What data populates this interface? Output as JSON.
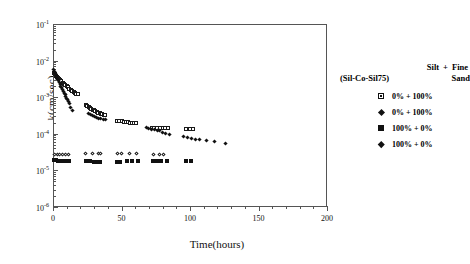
{
  "chart_data": {
    "type": "scatter",
    "title": "",
    "xlabel": "Time(hours)",
    "ylabel": "k(cm/sec)",
    "xlim": [
      0,
      200
    ],
    "ylim": [
      1e-06,
      0.1
    ],
    "yscale": "log",
    "xscale": "linear",
    "grid": false,
    "legend_position": "right",
    "xticks": [
      "0",
      "50",
      "100",
      "150",
      "200"
    ],
    "xtick_values": [
      0,
      50,
      100,
      150,
      200
    ],
    "ytick_labels": [
      "10",
      "10",
      "10",
      "10",
      "10",
      "10"
    ],
    "ytick_exponents": [
      "-1",
      "-2",
      "-3",
      "-4",
      "-5",
      "-6"
    ],
    "ytick_values": [
      0.1,
      0.01,
      0.001,
      0.0001,
      1e-05,
      1e-06
    ],
    "legend_header": {
      "line1_col1": "Silt",
      "line1_plus": "+",
      "line1_col2": "Fine",
      "line2_col1": "(Sil-Co-Sil75)",
      "line2_col2": "Sand"
    },
    "series": [
      {
        "name": "0% + 100% (open square)",
        "label": "0% + 100%",
        "marker": "open-square",
        "color": "#111111",
        "points": [
          [
            0.5,
            0.0046
          ],
          [
            1.2,
            0.0042
          ],
          [
            2.0,
            0.0039
          ],
          [
            2.8,
            0.0036
          ],
          [
            3.6,
            0.0033
          ],
          [
            4.4,
            0.0031
          ],
          [
            5.2,
            0.0029
          ],
          [
            6.0,
            0.0027
          ],
          [
            7.0,
            0.0025
          ],
          [
            8.0,
            0.0023
          ],
          [
            9.0,
            0.0021
          ],
          [
            10.0,
            0.002
          ],
          [
            11.0,
            0.00185
          ],
          [
            12.0,
            0.0017
          ],
          [
            13.0,
            0.0016
          ],
          [
            14.0,
            0.0015
          ],
          [
            15.0,
            0.0014
          ],
          [
            16.0,
            0.0013
          ],
          [
            17.0,
            0.00125
          ],
          [
            18.0,
            0.0012
          ],
          [
            24.0,
            0.00062
          ],
          [
            25.0,
            0.00058
          ],
          [
            26.0,
            0.00055
          ],
          [
            27.0,
            0.00052
          ],
          [
            28.0,
            0.00049
          ],
          [
            29.0,
            0.00046
          ],
          [
            30.0,
            0.00044
          ],
          [
            31.0,
            0.00042
          ],
          [
            32.0,
            0.0004
          ],
          [
            33.0,
            0.00038
          ],
          [
            34.0,
            0.00036
          ],
          [
            35.0,
            0.00035
          ],
          [
            36.0,
            0.00034
          ],
          [
            37.0,
            0.00033
          ],
          [
            38.0,
            0.00032
          ],
          [
            47.0,
            0.00023
          ],
          [
            48.5,
            0.000225
          ],
          [
            50.0,
            0.00022
          ],
          [
            51.5,
            0.000215
          ],
          [
            53.0,
            0.00021
          ],
          [
            54.5,
            0.000205
          ],
          [
            56.0,
            0.0002
          ],
          [
            57.5,
            0.0002
          ],
          [
            59.0,
            0.000195
          ],
          [
            60.5,
            0.000195
          ],
          [
            72.0,
            0.000145
          ],
          [
            74.0,
            0.000145
          ],
          [
            76.0,
            0.000145
          ],
          [
            78.0,
            0.000145
          ],
          [
            80.0,
            0.000145
          ],
          [
            82.0,
            0.000145
          ],
          [
            84.0,
            0.000145
          ],
          [
            97.0,
            0.000135
          ],
          [
            100.0,
            0.000135
          ],
          [
            102.0,
            0.000135
          ]
        ]
      },
      {
        "name": "0% + 100% (filled diamond)",
        "label": "0% + 100%",
        "marker": "filled-diamond",
        "color": "#111111",
        "points": [
          [
            0.4,
            0.0056
          ],
          [
            1.0,
            0.005
          ],
          [
            1.6,
            0.0044
          ],
          [
            2.2,
            0.0039
          ],
          [
            2.8,
            0.0035
          ],
          [
            3.4,
            0.0031
          ],
          [
            4.0,
            0.0028
          ],
          [
            4.6,
            0.0025
          ],
          [
            5.2,
            0.0022
          ],
          [
            5.8,
            0.002
          ],
          [
            6.4,
            0.0018
          ],
          [
            7.0,
            0.0016
          ],
          [
            7.6,
            0.00145
          ],
          [
            8.2,
            0.0013
          ],
          [
            8.8,
            0.00115
          ],
          [
            9.4,
            0.00105
          ],
          [
            10.0,
            0.00095
          ],
          [
            10.6,
            0.00086
          ],
          [
            11.2,
            0.00078
          ],
          [
            12.0,
            0.00068
          ],
          [
            13.0,
            0.00052
          ],
          [
            14.5,
            0.00042
          ],
          [
            26.0,
            0.00036
          ],
          [
            27.5,
            0.00034
          ],
          [
            29.0,
            0.00032
          ],
          [
            30.5,
            0.0003
          ],
          [
            32.0,
            0.000285
          ],
          [
            33.5,
            0.00027
          ],
          [
            35.0,
            0.00026
          ],
          [
            36.5,
            0.00025
          ],
          [
            38.0,
            0.000245
          ],
          [
            68.0,
            0.00015
          ],
          [
            70.0,
            0.00014
          ],
          [
            72.0,
            0.000135
          ],
          [
            74.0,
            0.00013
          ],
          [
            76.0,
            0.000125
          ],
          [
            78.0,
            0.00012
          ],
          [
            80.0,
            0.00011
          ],
          [
            82.0,
            0.000105
          ],
          [
            85.0,
            9.5e-05
          ],
          [
            95.0,
            8.2e-05
          ],
          [
            98.0,
            7.8e-05
          ],
          [
            101.0,
            7.5e-05
          ],
          [
            104.0,
            7.2e-05
          ],
          [
            107.0,
            7e-05
          ],
          [
            112.0,
            6.6e-05
          ],
          [
            118.0,
            6.3e-05
          ],
          [
            126.0,
            5.6e-05
          ]
        ]
      },
      {
        "name": "100% + 0% (filled square)",
        "label": "100% + 0%",
        "marker": "filled-square",
        "color": "#111111",
        "points": [
          [
            0.5,
            1.95e-05
          ],
          [
            1.5,
            1.9e-05
          ],
          [
            2.5,
            1.9e-05
          ],
          [
            3.5,
            1.85e-05
          ],
          [
            4.5,
            1.85e-05
          ],
          [
            5.5,
            1.85e-05
          ],
          [
            6.5,
            1.8e-05
          ],
          [
            7.5,
            1.8e-05
          ],
          [
            8.5,
            1.8e-05
          ],
          [
            9.5,
            1.8e-05
          ],
          [
            10.5,
            1.8e-05
          ],
          [
            11.5,
            1.8e-05
          ],
          [
            24.0,
            1.8e-05
          ],
          [
            27.0,
            1.8e-05
          ],
          [
            30.0,
            1.75e-05
          ],
          [
            32.0,
            1.75e-05
          ],
          [
            34.0,
            1.75e-05
          ],
          [
            47.0,
            1.75e-05
          ],
          [
            49.0,
            1.75e-05
          ],
          [
            54.0,
            1.8e-05
          ],
          [
            58.0,
            1.8e-05
          ],
          [
            62.0,
            1.8e-05
          ],
          [
            73.0,
            1.8e-05
          ],
          [
            76.0,
            1.8e-05
          ],
          [
            79.0,
            1.8e-05
          ],
          [
            83.0,
            1.8e-05
          ],
          [
            97.0,
            1.8e-05
          ],
          [
            101.0,
            1.8e-05
          ]
        ]
      },
      {
        "name": "100% + 0% (filled diamond small)",
        "label": "100% + 0%",
        "marker": "open-diamond",
        "color": "#111111",
        "points": [
          [
            1.0,
            2.8e-05
          ],
          [
            3.0,
            2.8e-05
          ],
          [
            5.0,
            2.8e-05
          ],
          [
            7.0,
            2.8e-05
          ],
          [
            9.0,
            2.8e-05
          ],
          [
            11.0,
            2.8e-05
          ],
          [
            24.0,
            2.9e-05
          ],
          [
            29.0,
            2.9e-05
          ],
          [
            33.0,
            2.85e-05
          ],
          [
            35.0,
            2.85e-05
          ],
          [
            47.0,
            2.9e-05
          ],
          [
            50.0,
            2.9e-05
          ],
          [
            56.0,
            2.85e-05
          ],
          [
            61.0,
            2.85e-05
          ],
          [
            73.0,
            2.8e-05
          ],
          [
            78.0,
            2.8e-05
          ],
          [
            81.0,
            2.8e-05
          ]
        ]
      }
    ]
  },
  "caption": {
    "text": ""
  }
}
